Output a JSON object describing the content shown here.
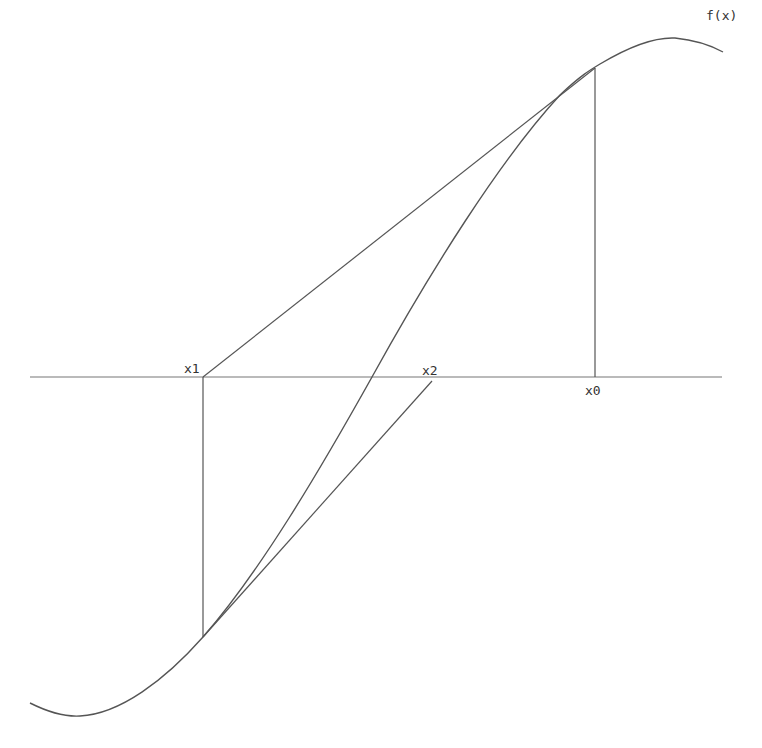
{
  "diagram": {
    "function_label": "f(x)",
    "points": {
      "x0": "x0",
      "x1": "x1",
      "x2": "x2"
    },
    "colors": {
      "line": "#555555",
      "axis": "#777777",
      "text": "#333333",
      "background": "#ffffff"
    },
    "elements": [
      {
        "name": "x-axis",
        "from": [
          30,
          377
        ],
        "to": [
          722,
          377
        ]
      },
      {
        "name": "curve-f",
        "shape": "sigmoid",
        "passes_through": [
          [
            30,
            703
          ],
          [
            78,
            716
          ],
          [
            203,
            637
          ],
          [
            372,
            377
          ],
          [
            595,
            68
          ],
          [
            672,
            38
          ],
          [
            723,
            52
          ]
        ]
      },
      {
        "name": "vertical-x0",
        "from": [
          595,
          377
        ],
        "to": [
          595,
          68
        ]
      },
      {
        "name": "vertical-x1",
        "from": [
          203,
          377
        ],
        "to": [
          203,
          637
        ]
      },
      {
        "name": "secant-x0-x1",
        "from": [
          595,
          68
        ],
        "to": [
          203,
          377
        ]
      },
      {
        "name": "secant-to-x2",
        "from": [
          203,
          637
        ],
        "to": [
          432,
          381
        ]
      }
    ]
  }
}
